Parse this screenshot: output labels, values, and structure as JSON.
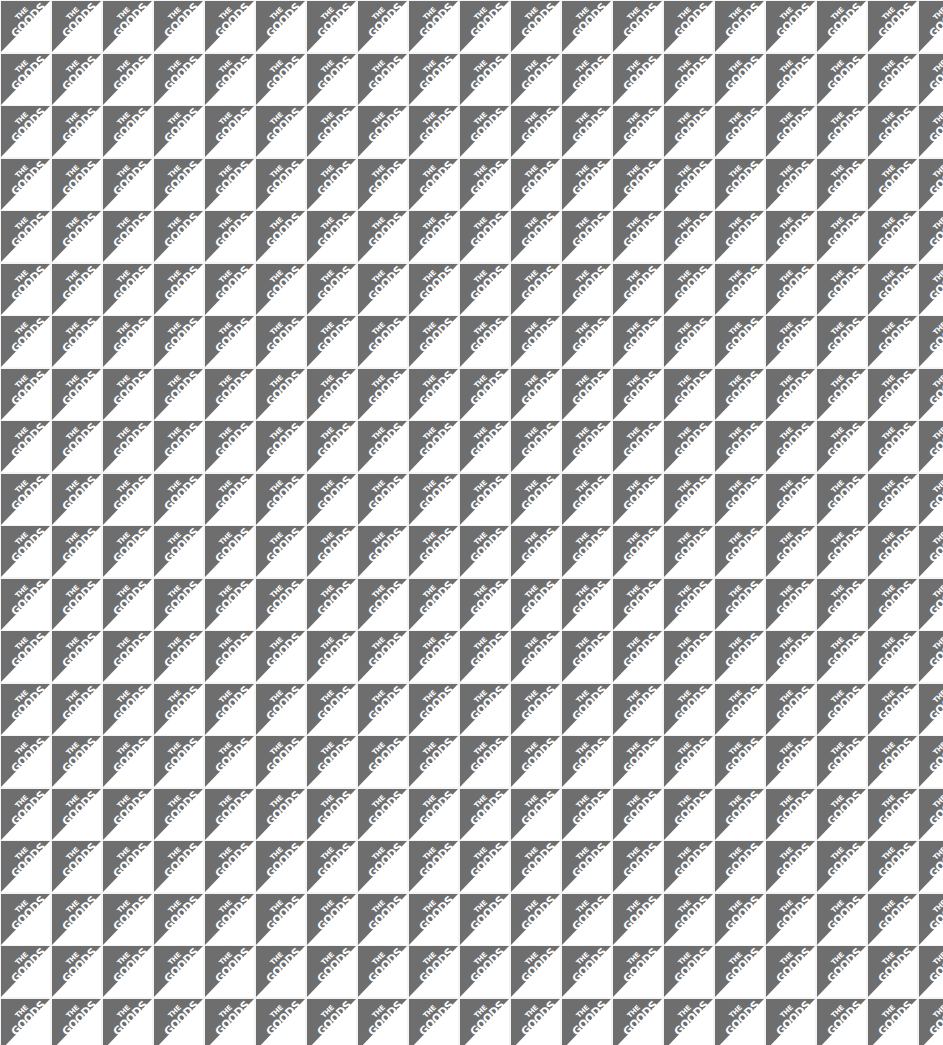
{
  "pattern": {
    "label_line1": "THE",
    "label_line2": "GOODS",
    "columns": 19,
    "rows": 20,
    "pitch_x": 51,
    "pitch_y": 52.5,
    "colors": {
      "triangle": "#6e6e6e",
      "background": "#ffffff",
      "gap": "#f4f4f4",
      "text": "#ffffff"
    }
  }
}
